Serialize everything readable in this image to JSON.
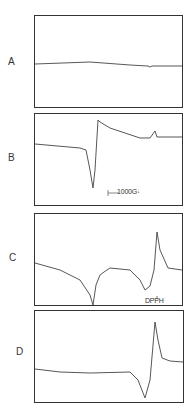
{
  "figure": {
    "panels": [
      {
        "label": "A"
      },
      {
        "label": "B",
        "scale_bar": "1000G",
        "scale_marker": "↓"
      },
      {
        "label": "C",
        "reference_label": "DPPH",
        "reference_marker": "↓"
      },
      {
        "label": "D"
      }
    ]
  },
  "chart_data": [
    {
      "type": "line",
      "title": "A",
      "xlabel": "",
      "ylabel": "",
      "grid": false,
      "description": "Nearly flat baseline ESR spectrum with slight drift and small glitch near right",
      "points": [
        [
          35,
          64
        ],
        [
          90,
          62
        ],
        [
          130,
          65
        ],
        [
          148,
          66
        ],
        [
          150,
          67
        ],
        [
          152,
          66
        ],
        [
          182,
          66
        ]
      ]
    },
    {
      "type": "line",
      "title": "B",
      "xlabel": "",
      "ylabel": "",
      "grid": false,
      "annotations": [
        "1000G scale bar",
        "arrow marker"
      ],
      "description": "Derivative ESR line: sharp minimum then maximum, broad decay and small sharp peak at right",
      "points": [
        [
          35,
          144
        ],
        [
          80,
          148
        ],
        [
          86,
          150
        ],
        [
          90,
          170
        ],
        [
          93,
          188
        ],
        [
          95,
          170
        ],
        [
          98,
          120
        ],
        [
          100,
          122
        ],
        [
          110,
          128
        ],
        [
          140,
          138
        ],
        [
          150,
          138
        ],
        [
          155,
          131
        ],
        [
          157,
          137
        ],
        [
          182,
          137
        ]
      ]
    },
    {
      "type": "line",
      "title": "C",
      "xlabel": "",
      "ylabel": "",
      "grid": false,
      "annotations": [
        "DPPH reference marker"
      ],
      "description": "Sharp minimum near center, plateau, broad dip then large derivative peak at DPPH position",
      "points": [
        [
          35,
          263
        ],
        [
          60,
          270
        ],
        [
          80,
          280
        ],
        [
          90,
          295
        ],
        [
          93,
          305
        ],
        [
          96,
          285
        ],
        [
          100,
          275
        ],
        [
          104,
          272
        ],
        [
          110,
          268
        ],
        [
          130,
          270
        ],
        [
          140,
          280
        ],
        [
          145,
          290
        ],
        [
          150,
          286
        ],
        [
          154,
          270
        ],
        [
          157,
          232
        ],
        [
          160,
          250
        ],
        [
          168,
          268
        ],
        [
          182,
          270
        ]
      ]
    },
    {
      "type": "line",
      "title": "D",
      "xlabel": "",
      "ylabel": "",
      "grid": false,
      "description": "Flat baseline with single derivative line near right: minimum then sharp maximum",
      "points": [
        [
          35,
          369
        ],
        [
          60,
          372
        ],
        [
          90,
          373
        ],
        [
          130,
          372
        ],
        [
          138,
          380
        ],
        [
          145,
          398
        ],
        [
          150,
          380
        ],
        [
          155,
          322
        ],
        [
          158,
          340
        ],
        [
          162,
          358
        ],
        [
          170,
          361
        ],
        [
          183,
          362
        ]
      ]
    }
  ]
}
